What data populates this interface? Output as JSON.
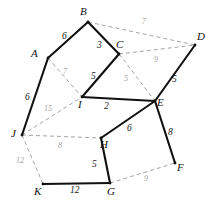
{
  "figure": {
    "type": "weighted-graph-diagram",
    "width": 217,
    "height": 212,
    "background": "#ffffff",
    "solid_edge_color": "#111111",
    "dashed_edge_color": "#9a9a9a"
  },
  "chart_data": {
    "type": "diagram",
    "title": "",
    "nodes": [
      {
        "id": "A",
        "label": "A",
        "x": 48,
        "y": 58,
        "label_x": 31,
        "label_y": 48
      },
      {
        "id": "B",
        "label": "B",
        "x": 88,
        "y": 22,
        "label_x": 80,
        "label_y": 6
      },
      {
        "id": "C",
        "label": "C",
        "x": 119,
        "y": 54,
        "label_x": 116,
        "label_y": 39
      },
      {
        "id": "D",
        "label": "D",
        "x": 195,
        "y": 45,
        "label_x": 197,
        "label_y": 31
      },
      {
        "id": "E",
        "label": "E",
        "x": 155,
        "y": 101,
        "label_x": 157,
        "label_y": 97
      },
      {
        "id": "F",
        "label": "F",
        "x": 175,
        "y": 163,
        "label_x": 177,
        "label_y": 162
      },
      {
        "id": "G",
        "label": "G",
        "x": 110,
        "y": 183,
        "label_x": 107,
        "label_y": 186
      },
      {
        "id": "H",
        "label": "H",
        "x": 101,
        "y": 138,
        "label_x": 100,
        "label_y": 139
      },
      {
        "id": "I",
        "label": "I",
        "x": 82,
        "y": 97,
        "label_x": 78,
        "label_y": 99
      },
      {
        "id": "J",
        "label": "J",
        "x": 22,
        "y": 135,
        "label_x": 11,
        "label_y": 128
      },
      {
        "id": "K",
        "label": "K",
        "x": 43,
        "y": 184,
        "label_x": 34,
        "label_y": 186
      }
    ],
    "edges": [
      {
        "from": "A",
        "to": "B",
        "weight": "6",
        "style": "solid",
        "label_x": 62,
        "label_y": 32
      },
      {
        "from": "B",
        "to": "C",
        "weight": "3",
        "style": "solid",
        "label_x": 97,
        "label_y": 41
      },
      {
        "from": "C",
        "to": "I",
        "weight": "5",
        "style": "solid",
        "label_x": 91,
        "label_y": 72
      },
      {
        "from": "I",
        "to": "E",
        "weight": "2",
        "style": "solid",
        "label_x": 104,
        "label_y": 102
      },
      {
        "from": "D",
        "to": "E",
        "weight": "5",
        "style": "solid",
        "label_x": 172,
        "label_y": 75
      },
      {
        "from": "E",
        "to": "F",
        "weight": "8",
        "style": "solid",
        "label_x": 168,
        "label_y": 128
      },
      {
        "from": "E",
        "to": "H",
        "weight": "6",
        "style": "solid",
        "label_x": 127,
        "label_y": 124
      },
      {
        "from": "H",
        "to": "G",
        "weight": "5",
        "style": "solid",
        "label_x": 92,
        "label_y": 160
      },
      {
        "from": "K",
        "to": "G",
        "weight": "12",
        "style": "solid",
        "label_x": 70,
        "label_y": 186
      },
      {
        "from": "A",
        "to": "J",
        "weight": "6",
        "style": "solid",
        "label_x": 25,
        "label_y": 93
      },
      {
        "from": "B",
        "to": "D",
        "weight": "7",
        "style": "dashed",
        "label_x": 142,
        "label_y": 18
      },
      {
        "from": "C",
        "to": "D",
        "weight": "9",
        "style": "dashed",
        "label_x": 154,
        "label_y": 56
      },
      {
        "from": "C",
        "to": "E",
        "weight": "5",
        "style": "dashed",
        "label_x": 124,
        "label_y": 75
      },
      {
        "from": "A",
        "to": "I",
        "weight": "7",
        "style": "dashed",
        "label_x": 63,
        "label_y": 68
      },
      {
        "from": "J",
        "to": "I",
        "weight": "15",
        "style": "dashed",
        "label_x": 44,
        "label_y": 105
      },
      {
        "from": "J",
        "to": "H",
        "weight": "8",
        "style": "dashed",
        "label_x": 58,
        "label_y": 142
      },
      {
        "from": "J",
        "to": "K",
        "weight": "12",
        "style": "dashed",
        "label_x": 16,
        "label_y": 157
      },
      {
        "from": "G",
        "to": "F",
        "weight": "9",
        "style": "dashed",
        "label_x": 144,
        "label_y": 175
      }
    ]
  }
}
